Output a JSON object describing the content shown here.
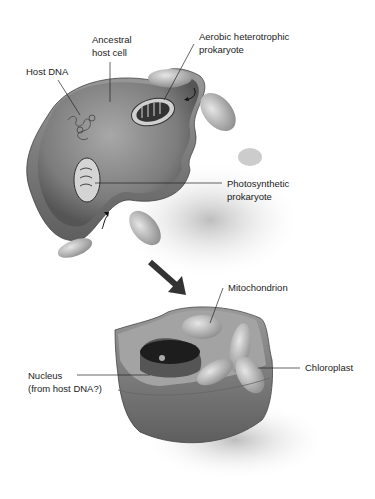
{
  "figure": {
    "top_stage": {
      "labels": {
        "ancestral_host_cell": [
          "Ancestral",
          "host cell"
        ],
        "host_dna": [
          "Host DNA"
        ],
        "aerobic_prokaryote": [
          "Aerobic heterotrophic",
          "prokaryote"
        ],
        "photosynthetic_prokaryote": [
          "Photosynthetic",
          "prokaryote"
        ]
      }
    },
    "bottom_stage": {
      "labels": {
        "mitochondrion": [
          "Mitochondrion"
        ],
        "nucleus": [
          "Nucleus",
          "(from host DNA?)"
        ],
        "chloroplast": [
          "Chloroplast"
        ]
      }
    },
    "colors": {
      "background": "#ffffff",
      "cell_fill": "#8a8a8a",
      "cell_dark": "#5a5a5a",
      "organelle": "#c8c8c8",
      "text": "#222222"
    }
  }
}
